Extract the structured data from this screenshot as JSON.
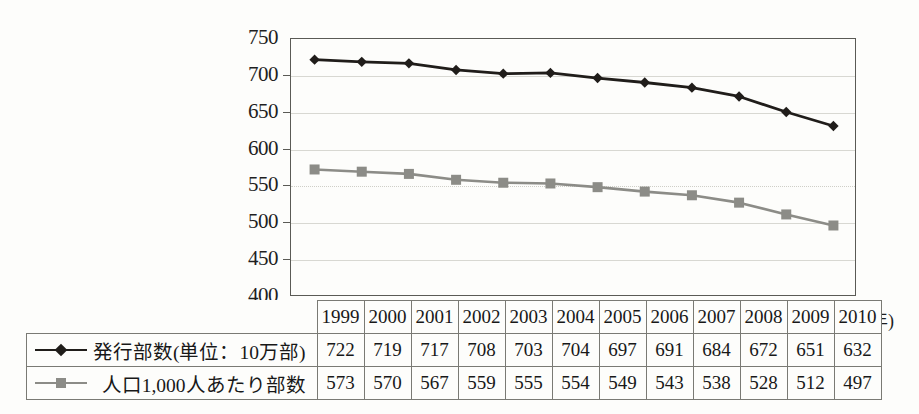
{
  "chart_data": {
    "type": "line",
    "title": "",
    "xlabel": "(年)",
    "ylabel": "",
    "ylim": [
      400,
      750
    ],
    "ytick_step": 50,
    "yticks": [
      750,
      700,
      650,
      600,
      550,
      500,
      450,
      400
    ],
    "grid": true,
    "grid_note": "solid light gridlines at 700,650,600,500,450; dotted gridline at 550",
    "legend_position": "table-left",
    "categories": [
      "1999",
      "2000",
      "2001",
      "2002",
      "2003",
      "2004",
      "2005",
      "2006",
      "2007",
      "2008",
      "2009",
      "2010"
    ],
    "series": [
      {
        "name": "発行部数(単位：10万部)",
        "marker": "diamond",
        "color": "#201d1a",
        "values": [
          722,
          719,
          717,
          708,
          703,
          704,
          697,
          691,
          684,
          672,
          651,
          632
        ]
      },
      {
        "name": "人口1,000人あたり部数",
        "marker": "square",
        "color": "#8c8c87",
        "values": [
          573,
          570,
          567,
          559,
          555,
          554,
          549,
          543,
          538,
          528,
          512,
          497
        ]
      }
    ]
  },
  "axis": {
    "unit_label": "(年)"
  },
  "table": {
    "year_header": [
      "1999",
      "2000",
      "2001",
      "2002",
      "2003",
      "2004",
      "2005",
      "2006",
      "2007",
      "2008",
      "2009",
      "2010"
    ],
    "rows": [
      {
        "label": "発行部数(単位：10万部)",
        "marker": "diamond-marker-icon",
        "values": [
          "722",
          "719",
          "717",
          "708",
          "703",
          "704",
          "697",
          "691",
          "684",
          "672",
          "651",
          "632"
        ]
      },
      {
        "label": "人口1,000人あたり部数",
        "marker": "square-marker-icon",
        "values": [
          "573",
          "570",
          "567",
          "559",
          "555",
          "554",
          "549",
          "543",
          "538",
          "528",
          "512",
          "497"
        ]
      }
    ]
  },
  "colors": {
    "series_primary": "#201d1a",
    "series_secondary": "#8c8c87",
    "axis": "#5a5a55",
    "grid": "#d8d8d2",
    "background": "#fdfdfb"
  }
}
